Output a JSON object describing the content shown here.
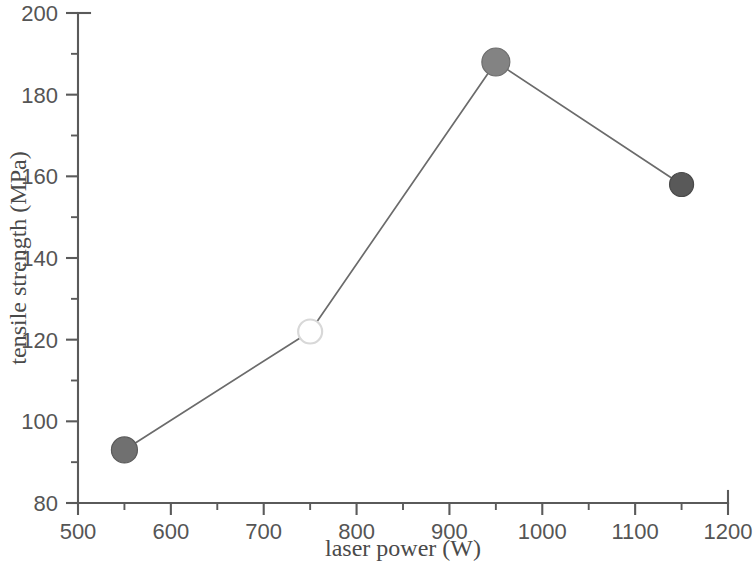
{
  "chart_data": {
    "type": "line",
    "title": "",
    "subtitle": "",
    "xlabel": "laser power (W)",
    "ylabel": "tensile strength (MPa)",
    "xlim": [
      500,
      1200
    ],
    "ylim": [
      80,
      200
    ],
    "x_major_ticks": [
      500,
      600,
      700,
      800,
      900,
      1000,
      1100,
      1200
    ],
    "x_minor_ticks": [
      550,
      650,
      750,
      850,
      950,
      1050,
      1150
    ],
    "y_major_ticks": [
      80,
      100,
      120,
      140,
      160,
      180,
      200
    ],
    "y_minor_ticks": [
      90,
      110,
      130,
      150,
      170,
      190
    ],
    "x_tick_labels": [
      "500",
      "600",
      "700",
      "800",
      "900",
      "1000",
      "1100",
      "1200"
    ],
    "y_tick_labels": [
      "80",
      "100",
      "120",
      "140",
      "160",
      "180",
      "200"
    ],
    "grid": false,
    "legend": false,
    "legend_position": "none",
    "x": [
      550,
      750,
      950,
      1150
    ],
    "values": [
      93,
      122,
      188,
      158
    ],
    "series": [
      {
        "name": "tensile strength",
        "x": [
          550,
          750,
          950,
          1150
        ],
        "values": [
          93,
          122,
          188,
          158
        ],
        "line_color": "#6b6b6b",
        "points": [
          {
            "x": 550,
            "y": 93,
            "marker": "filled-circle",
            "fill": "#707070",
            "stroke": "#5a5a5a",
            "radius": 13
          },
          {
            "x": 750,
            "y": 122,
            "marker": "open-circle",
            "fill": "#ffffff",
            "stroke": "#d8d8d8",
            "radius": 12
          },
          {
            "x": 950,
            "y": 188,
            "marker": "filled-circle",
            "fill": "#838383",
            "stroke": "#6d6d6d",
            "radius": 14
          },
          {
            "x": 1150,
            "y": 158,
            "marker": "filled-circle",
            "fill": "#595959",
            "stroke": "#4a4a4a",
            "radius": 12
          }
        ]
      }
    ]
  },
  "axes": {
    "x_axis_name": "laser-power-axis",
    "y_axis_name": "tensile-strength-axis"
  },
  "colors": {
    "axis": "#5a5a5a",
    "text": "#4a4a4a",
    "tick_text": "#555555",
    "line": "#6b6b6b",
    "background": "#ffffff"
  }
}
